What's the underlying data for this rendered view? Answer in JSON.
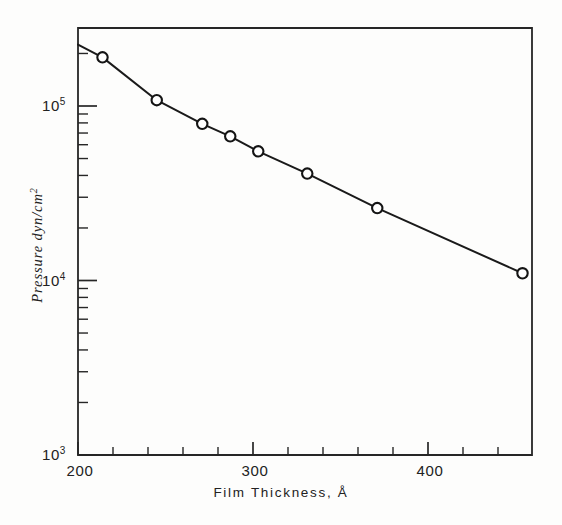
{
  "chart_data": {
    "type": "scatter",
    "title": "",
    "subtitle": "",
    "xlabel": "Film Thickness, Å",
    "ylabel": "Pressure dyn/cm",
    "ylabel_exponent": "2",
    "xlim": [
      200,
      460
    ],
    "ylim": [
      1000,
      220000
    ],
    "yscale": "log",
    "xscale": "linear",
    "grid": false,
    "legend": null,
    "x_ticks_major": [
      200,
      300,
      400
    ],
    "x_tick_labels": [
      "200",
      "300",
      "400"
    ],
    "x_ticks_minor": [
      220,
      240,
      260,
      280,
      320,
      340,
      360,
      380,
      420,
      440,
      460
    ],
    "y_ticks_major": [
      1000,
      10000,
      100000
    ],
    "y_tick_labels": [
      "10",
      "10",
      "10"
    ],
    "y_tick_exponents": [
      "3",
      "4",
      "5"
    ],
    "y_ticks_minor": [
      2000,
      3000,
      4000,
      5000,
      6000,
      7000,
      8000,
      9000,
      20000,
      30000,
      40000,
      50000,
      60000,
      70000,
      80000,
      90000,
      200000
    ],
    "series": [
      {
        "name": "Pressure vs Film Thickness",
        "marker": "open-circle",
        "line_style": "solid",
        "color": "#1a1a1a",
        "x": [
          214,
          245,
          271,
          287,
          303,
          331,
          371,
          454
        ],
        "y": [
          190000,
          108000,
          79000,
          67000,
          55000,
          41000,
          26000,
          11000
        ]
      }
    ],
    "line_endpoints": {
      "start": {
        "x": 200,
        "y": 225000
      },
      "end": {
        "x": 454,
        "y": 11000
      }
    }
  },
  "figure": {
    "background_color": "#fdfdfc",
    "ink_color": "#1a1a1a",
    "marker_fill": "#ffffff"
  }
}
